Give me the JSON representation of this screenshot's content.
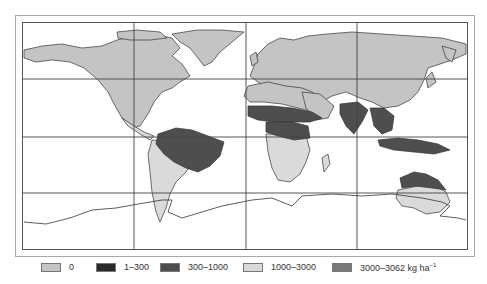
{
  "map": {
    "type": "choropleth world map",
    "projection": "equirectangular",
    "graticule": {
      "columns": 4,
      "rows": 4
    },
    "colors": {
      "zero": "#c4c4c4",
      "c1_300": "#2a2a2a",
      "c300_1000": "#4e4e4e",
      "c1000_3000": "#dadada",
      "c3000_3062": "#7a7a7a",
      "ocean": "#ffffff",
      "border": "#333333"
    }
  },
  "legend": {
    "items": [
      {
        "label": "0",
        "color": "#c4c4c4"
      },
      {
        "label": "1–300",
        "color": "#2a2a2a"
      },
      {
        "label": "300–1000",
        "color": "#4e4e4e"
      },
      {
        "label": "1000–3000",
        "color": "#dadada"
      },
      {
        "label": "3000–3062 kg ha",
        "color": "#7a7a7a"
      }
    ],
    "unit_superscript": "−1"
  }
}
